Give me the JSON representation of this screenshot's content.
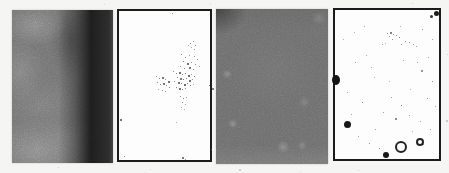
{
  "figure": {
    "background_color": "#f5f5f3",
    "map_background_color": "#fdfdfd",
    "map_border_color": "#1b1b1b",
    "panels": [
      {
        "name": "mammogram-roi-a",
        "type": "grayscale-roi",
        "base_color": "#9a9a9a",
        "dark_band_color": "#1c1c1c"
      },
      {
        "name": "detection-map-a",
        "type": "binary-map",
        "dots": [
          [
            53,
            2,
            1,
            "#777"
          ],
          [
            71,
            32,
            1,
            "#555"
          ],
          [
            74,
            30,
            1,
            "#777"
          ],
          [
            76,
            34,
            1,
            "#666"
          ],
          [
            72,
            36,
            1,
            "#888"
          ],
          [
            69,
            34,
            1,
            "#999"
          ],
          [
            75,
            38,
            1,
            "#777"
          ],
          [
            62,
            43,
            1,
            "#666"
          ],
          [
            66,
            46,
            1,
            "#555"
          ],
          [
            70,
            44,
            1,
            "#888"
          ],
          [
            75,
            45,
            1,
            "#777"
          ],
          [
            78,
            48,
            1,
            "#666"
          ],
          [
            64,
            50,
            1,
            "#555"
          ],
          [
            68,
            52,
            2,
            "#444"
          ],
          [
            72,
            51,
            1,
            "#777"
          ],
          [
            76,
            53,
            1,
            "#666"
          ],
          [
            80,
            55,
            1,
            "#888"
          ],
          [
            61,
            55,
            1,
            "#777"
          ],
          [
            65,
            57,
            1,
            "#555"
          ],
          [
            70,
            56,
            2,
            "#4a4a4a"
          ],
          [
            74,
            58,
            1,
            "#666"
          ],
          [
            54,
            60,
            1,
            "#777"
          ],
          [
            57,
            62,
            1,
            "#555"
          ],
          [
            60,
            61,
            2,
            "#444"
          ],
          [
            63,
            63,
            1,
            "#666"
          ],
          [
            66,
            62,
            1,
            "#555"
          ],
          [
            69,
            64,
            2,
            "#3d3d3d"
          ],
          [
            72,
            63,
            1,
            "#777"
          ],
          [
            75,
            65,
            1,
            "#555"
          ],
          [
            58,
            66,
            1,
            "#666"
          ],
          [
            61,
            67,
            2,
            "#484848"
          ],
          [
            64,
            68,
            1,
            "#555"
          ],
          [
            67,
            67,
            1,
            "#666"
          ],
          [
            70,
            69,
            2,
            "#404040"
          ],
          [
            73,
            68,
            1,
            "#777"
          ],
          [
            55,
            70,
            1,
            "#666"
          ],
          [
            59,
            71,
            2,
            "#4a4a4a"
          ],
          [
            62,
            72,
            1,
            "#555"
          ],
          [
            65,
            73,
            2,
            "#3e3e3e"
          ],
          [
            68,
            72,
            1,
            "#666"
          ],
          [
            71,
            74,
            1,
            "#555"
          ],
          [
            74,
            73,
            1,
            "#888"
          ],
          [
            57,
            76,
            1,
            "#666"
          ],
          [
            60,
            77,
            2,
            "#4a4a4a"
          ],
          [
            63,
            78,
            1,
            "#555"
          ],
          [
            66,
            77,
            1,
            "#777"
          ],
          [
            37,
            65,
            1,
            "#777"
          ],
          [
            40,
            67,
            1,
            "#555"
          ],
          [
            43,
            66,
            2,
            "#4a4a4a"
          ],
          [
            46,
            68,
            1,
            "#666"
          ],
          [
            49,
            70,
            2,
            "#444"
          ],
          [
            38,
            71,
            1,
            "#777"
          ],
          [
            41,
            73,
            1,
            "#555"
          ],
          [
            44,
            72,
            2,
            "#464646"
          ],
          [
            47,
            74,
            1,
            "#666"
          ],
          [
            50,
            76,
            1,
            "#555"
          ],
          [
            39,
            78,
            1,
            "#888"
          ],
          [
            43,
            79,
            1,
            "#666"
          ],
          [
            46,
            80,
            1,
            "#777"
          ],
          [
            61,
            85,
            1,
            "#666"
          ],
          [
            64,
            87,
            1,
            "#555"
          ],
          [
            67,
            86,
            1,
            "#777"
          ],
          [
            63,
            91,
            1,
            "#666"
          ],
          [
            66,
            93,
            1,
            "#888"
          ],
          [
            62,
            96,
            1,
            "#777"
          ],
          [
            65,
            98,
            1,
            "#999"
          ],
          [
            90,
            74,
            1,
            "#555"
          ],
          [
            93,
            77,
            2,
            "#555"
          ],
          [
            1,
            108,
            2,
            "#444"
          ],
          [
            57,
            111,
            1,
            "#999"
          ],
          [
            5,
            145,
            1,
            "#666"
          ],
          [
            63,
            146,
            2,
            "#4a4a4a"
          ],
          [
            66,
            148,
            1,
            "#777"
          ],
          [
            92,
            138,
            1,
            "#666"
          ]
        ]
      },
      {
        "name": "mammogram-roi-b",
        "type": "grayscale-roi",
        "base_color": "#8f8f8f"
      },
      {
        "name": "detection-map-b",
        "type": "binary-map",
        "dots": [
          [
            99,
            1,
            5,
            "#1f1f1f"
          ],
          [
            95,
            5,
            3,
            "#333"
          ],
          [
            -3,
            65,
            8,
            "#151515",
            10
          ],
          [
            9,
            111,
            7,
            "#181818"
          ],
          [
            48,
            142,
            6,
            "#181818"
          ],
          [
            52,
            23,
            1,
            "#666"
          ],
          [
            55,
            22,
            2,
            "#555"
          ],
          [
            58,
            24,
            1,
            "#777"
          ],
          [
            54,
            26,
            1,
            "#888"
          ],
          [
            61,
            25,
            1,
            "#666"
          ],
          [
            64,
            27,
            1,
            "#555"
          ],
          [
            57,
            29,
            1,
            "#777"
          ],
          [
            66,
            34,
            1,
            "#666"
          ],
          [
            70,
            31,
            1,
            "#888"
          ],
          [
            74,
            32,
            1,
            "#666"
          ],
          [
            78,
            34,
            1,
            "#777"
          ],
          [
            81,
            36,
            1,
            "#888"
          ],
          [
            47,
            34,
            1,
            "#777"
          ],
          [
            50,
            33,
            1,
            "#999"
          ],
          [
            20,
            52,
            1,
            "#777"
          ],
          [
            12,
            82,
            1,
            "#888"
          ],
          [
            27,
            92,
            1,
            "#666"
          ],
          [
            39,
            67,
            1,
            "#999"
          ],
          [
            68,
            50,
            1,
            "#888"
          ],
          [
            82,
            52,
            1,
            "#777"
          ],
          [
            93,
            47,
            1,
            "#888"
          ],
          [
            97,
            71,
            1,
            "#666"
          ],
          [
            75,
            79,
            1,
            "#999"
          ],
          [
            56,
            87,
            1,
            "#777"
          ],
          [
            66,
            95,
            1,
            "#555"
          ],
          [
            48,
            102,
            1,
            "#888"
          ],
          [
            60,
            108,
            2,
            "#666"
          ],
          [
            74,
            105,
            1,
            "#777"
          ],
          [
            85,
            111,
            1,
            "#888"
          ],
          [
            95,
            119,
            1,
            "#777"
          ],
          [
            23,
            126,
            1,
            "#888"
          ],
          [
            34,
            133,
            1,
            "#777"
          ],
          [
            44,
            138,
            1,
            "#666"
          ],
          [
            77,
            121,
            1,
            "#999"
          ],
          [
            92,
            88,
            1,
            "#777"
          ],
          [
            100,
            96,
            1,
            "#888"
          ],
          [
            19,
            22,
            1,
            "#999"
          ],
          [
            29,
            16,
            1,
            "#888"
          ],
          [
            87,
            19,
            1,
            "#777"
          ],
          [
            65,
            16,
            1,
            "#999"
          ],
          [
            40,
            119,
            1,
            "#888"
          ],
          [
            31,
            45,
            1,
            "#999"
          ],
          [
            16,
            104,
            1,
            "#888"
          ],
          [
            88,
            134,
            1,
            "#777"
          ],
          [
            97,
            29,
            1,
            "#888"
          ],
          [
            8,
            29,
            1,
            "#999"
          ],
          [
            36,
            57,
            1,
            "#888"
          ],
          [
            86,
            60,
            2,
            "#777"
          ],
          [
            54,
            71,
            1,
            "#999"
          ]
        ],
        "rings": [
          [
            60,
            131,
            12,
            2,
            "#222"
          ],
          [
            81,
            128,
            8,
            2,
            "#222"
          ]
        ]
      }
    ],
    "page_specks": [
      [
        58,
        167,
        1,
        "#c4c4c4"
      ],
      [
        150,
        169,
        1,
        "#c8c8c8"
      ],
      [
        239,
        169,
        2,
        "#c2c2c2"
      ],
      [
        300,
        171,
        1,
        "#cccccc"
      ],
      [
        446,
        120,
        2,
        "#b8b8b8"
      ],
      [
        447,
        54,
        1,
        "#c8c8c8"
      ],
      [
        210,
        3,
        1,
        "#cfcfcf"
      ],
      [
        358,
        170,
        1,
        "#c8c8c8"
      ],
      [
        104,
        4,
        1,
        "#d0d0d0"
      ],
      [
        412,
        3,
        1,
        "#c4c4c4"
      ]
    ]
  }
}
